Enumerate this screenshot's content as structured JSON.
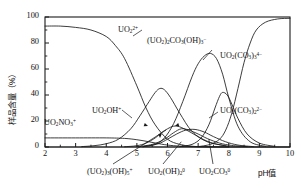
{
  "chart_data": {
    "type": "line",
    "title": "",
    "xlabel": "pH值",
    "ylabel": "样品含量（%）",
    "xlim": [
      2,
      10
    ],
    "ylim": [
      0,
      100
    ],
    "xticks": [
      2,
      3,
      4,
      5,
      6,
      7,
      8,
      9,
      10
    ],
    "yticks": [
      0,
      20,
      40,
      60,
      80,
      100
    ],
    "yminorticks": [
      10,
      30,
      50,
      70,
      90
    ],
    "grid": false,
    "legend": "inline-annotations",
    "series": [
      {
        "name": "UO2(2+)",
        "label": "UO₂²⁺",
        "label_html": "UO<sub>2</sub><sup>2+</sup>",
        "x": [
          2.0,
          2.5,
          3.0,
          3.5,
          4.0,
          4.3,
          4.6,
          5.0,
          5.3,
          5.6,
          6.0,
          6.4,
          6.8,
          7.2,
          8.0
        ],
        "y": [
          93,
          93,
          92,
          90,
          85,
          78,
          68,
          47,
          30,
          17,
          6,
          2,
          0.6,
          0.2,
          0
        ]
      },
      {
        "name": "UO2NO3(+)",
        "label": "UO₂NO₃⁺",
        "label_html": "UO<sub>2</sub>NO<sub>3</sub><sup>+</sup>",
        "x": [
          2.0,
          3.0,
          4.0,
          4.6,
          5.0,
          5.4,
          5.8,
          6.2,
          6.8,
          7.5,
          10.0
        ],
        "y": [
          7,
          7,
          7,
          6.6,
          5.6,
          4.0,
          2.2,
          1.0,
          0.3,
          0.1,
          0
        ]
      },
      {
        "name": "UO2OH(+)",
        "label": "UO₂OH⁺",
        "label_html": "UO<sub>2</sub>OH<sup>+</sup>",
        "x": [
          3.2,
          3.6,
          4.0,
          4.4,
          4.8,
          5.1,
          5.4,
          5.6,
          5.75,
          5.9,
          6.1,
          6.4,
          6.8,
          7.3,
          8.0
        ],
        "y": [
          0.3,
          1.0,
          2.5,
          6,
          14,
          24,
          35,
          42,
          45,
          44,
          38,
          26,
          12,
          4,
          0.6
        ]
      },
      {
        "name": "(UO2)3(OH)5(+)",
        "label": "(UO₂)₃(OH)₅⁺",
        "label_html": "(UO<sub>2</sub>)<sub>3</sub>(OH)<sub>5</sub><sup>+</sup>",
        "x": [
          4.6,
          5.0,
          5.3,
          5.6,
          5.8,
          6.0,
          6.2,
          6.4,
          6.7,
          7.0,
          7.4,
          7.9
        ],
        "y": [
          0.2,
          1.0,
          3,
          7,
          11,
          14,
          16,
          15.5,
          12,
          8,
          3.5,
          0.8
        ]
      },
      {
        "name": "UO2(OH)2(0)",
        "label": "UO₂(OH)₂⁰",
        "label_html": "UO<sub>2</sub>(OH)<sub>2</sub><sup>0</sup>",
        "x": [
          5.0,
          5.5,
          5.9,
          6.2,
          6.45,
          6.7,
          7.0,
          7.3,
          7.7,
          8.1,
          8.6
        ],
        "y": [
          0.2,
          2,
          6,
          11,
          14,
          13,
          10,
          6.5,
          3,
          1.2,
          0.3
        ]
      },
      {
        "name": "UO2CO3(0)",
        "label": "UO₂CO₃⁰",
        "label_html": "UO<sub>2</sub>CO<sub>3</sub><sup>0</sup>",
        "x": [
          5.2,
          5.7,
          6.0,
          6.3,
          6.6,
          6.9,
          7.2,
          7.5,
          7.9,
          8.3,
          8.8
        ],
        "y": [
          0.2,
          2.5,
          6,
          10,
          13,
          13.5,
          11.5,
          8,
          4,
          1.5,
          0.3
        ]
      },
      {
        "name": "(UO2)2CO3(OH)3(-)",
        "label": "(UO₂)₂CO₃(OH)₃⁻",
        "label_html": "(UO<sub>2</sub>)<sub>2</sub>CO<sub>3</sub>(OH)<sub>3</sub><sup>−</sup>",
        "x": [
          5.2,
          5.6,
          5.9,
          6.2,
          6.5,
          6.8,
          7.0,
          7.2,
          7.4,
          7.6,
          7.8,
          8.0,
          8.3,
          8.7,
          9.2
        ],
        "y": [
          0.3,
          2,
          7,
          18,
          35,
          54,
          64,
          70,
          72,
          68,
          56,
          38,
          16,
          4,
          0.5
        ]
      },
      {
        "name": "UO2(CO3)2(2-)",
        "label": "UO₂(CO₃)₂²⁻",
        "label_html": "UO<sub>2</sub>(CO<sub>3</sub>)<sub>2</sub><sup>2−</sup>",
        "x": [
          6.4,
          6.8,
          7.1,
          7.35,
          7.55,
          7.7,
          7.8,
          7.95,
          8.1,
          8.3,
          8.6,
          9.0,
          9.5
        ],
        "y": [
          0.3,
          2,
          7,
          17,
          30,
          39,
          42,
          40,
          33,
          22,
          10,
          3,
          0.5
        ]
      },
      {
        "name": "UO2(CO3)3(4-)",
        "label": "UO₂(CO₃)₃⁴⁻",
        "label_html": "UO<sub>2</sub>(CO<sub>3</sub>)<sub>3</sub><sup>4−</sup>",
        "x": [
          7.0,
          7.4,
          7.7,
          7.9,
          8.1,
          8.3,
          8.5,
          8.7,
          8.9,
          9.2,
          9.6,
          10.0
        ],
        "y": [
          0.3,
          2,
          6,
          13,
          26,
          45,
          65,
          80,
          90,
          96,
          98.5,
          99
        ]
      }
    ],
    "inline_labels": [
      {
        "ref": "UO2(2+)",
        "x_px": 118,
        "y_px": 26
      },
      {
        "ref": "(UO2)2CO3(OH)3(-)",
        "x_px": 147,
        "y_px": 37
      },
      {
        "ref": "UO2(CO3)3(4-)",
        "x_px": 220,
        "y_px": 52
      },
      {
        "ref": "UO2(CO3)2(2-)",
        "x_px": 220,
        "y_px": 107
      },
      {
        "ref": "UO2OH(+)",
        "x_px": 92,
        "y_px": 107
      },
      {
        "ref": "UO2NO3(+)",
        "x_px": 44,
        "y_px": 119
      }
    ],
    "below_axis_labels": [
      {
        "ref": "(UO2)3(OH)5(+)",
        "x_px": 87,
        "y_px": 168
      },
      {
        "ref": "UO2(OH)2(0)",
        "x_px": 148,
        "y_px": 168
      },
      {
        "ref": "UO2CO3(0)",
        "x_px": 199,
        "y_px": 168
      }
    ]
  },
  "axes": {
    "x_tick_labels": [
      "2",
      "3",
      "4",
      "5",
      "6",
      "7",
      "8",
      "9",
      "10"
    ],
    "y_tick_labels": [
      "0",
      "20",
      "40",
      "60",
      "80",
      "100"
    ],
    "x_axis_title": "pH值",
    "y_axis_title": "样品含量（%）"
  },
  "colors": {
    "line": "#1a1a1a",
    "axis": "#1a1a1a",
    "background": "#ffffff",
    "text": "#111111"
  }
}
